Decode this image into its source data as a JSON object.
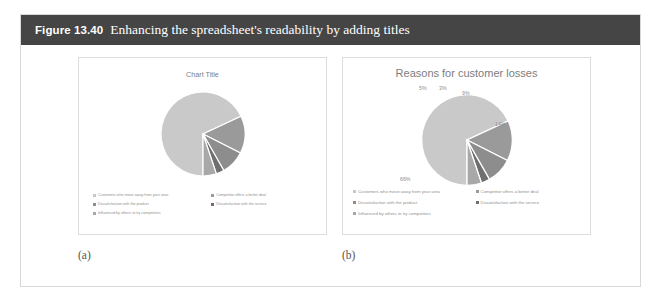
{
  "figure": {
    "number": "Figure 13.40",
    "caption": "Enhancing the spreadsheet's readability by adding titles",
    "banner_color": "#454545",
    "frame_color": "#d8d8d8"
  },
  "panels": [
    {
      "sub_caption": "(a)",
      "chart_data": {
        "type": "pie",
        "title": "Chart Title",
        "show_data_labels": false,
        "legend_position": "bottom",
        "categories": [
          "Customers who move away from your area",
          "Competitor offers a better deal",
          "Dissatisfaction with the product",
          "Dissatisfaction with the service",
          "Influenced by others to try competitors"
        ],
        "values": [
          66,
          14,
          9,
          3,
          5
        ],
        "labels": [
          "66%",
          "14%",
          "9%",
          "3%",
          "5%"
        ],
        "colors": [
          "#c9c9c9",
          "#9a9a9a",
          "#8d8d8d",
          "#6f6f6f",
          "#a8a8a8"
        ]
      }
    },
    {
      "sub_caption": "(b)",
      "chart_data": {
        "type": "pie",
        "title": "Reasons for customer losses",
        "show_data_labels": true,
        "legend_position": "bottom",
        "categories": [
          "Customers who move away from your area",
          "Competitor offers a better deal",
          "Dissatisfaction with the product",
          "Dissatisfaction with the service",
          "Influenced by others to try competitors"
        ],
        "values": [
          66,
          14,
          9,
          3,
          5
        ],
        "labels": [
          "66%",
          "14%",
          "9%",
          "3%",
          "5%"
        ],
        "colors": [
          "#c9c9c9",
          "#9a9a9a",
          "#8d8d8d",
          "#6f6f6f",
          "#a8a8a8"
        ]
      }
    }
  ]
}
